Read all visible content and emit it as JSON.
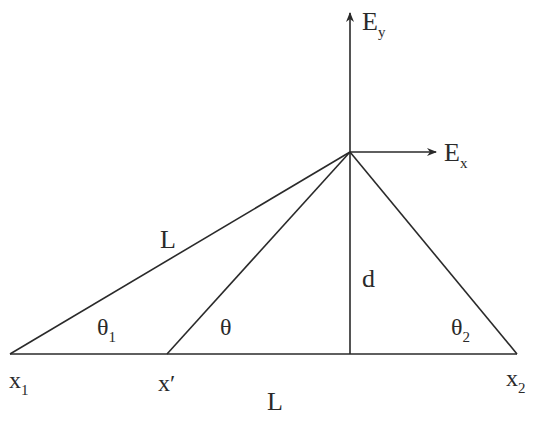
{
  "diagram": {
    "colors": {
      "line": "#2a2a2a",
      "background": "#ffffff"
    },
    "points": {
      "x1": [
        10,
        354
      ],
      "x_prime": [
        167,
        354
      ],
      "foot": [
        350,
        354
      ],
      "x2": [
        517,
        354
      ],
      "apex": [
        350,
        152
      ]
    },
    "labels": {
      "Ey": {
        "main": "E",
        "sub": "y"
      },
      "Ex": {
        "main": "E",
        "sub": "x"
      },
      "L_hyp": "L",
      "d": "d",
      "theta1": {
        "main": "θ",
        "sub": "1"
      },
      "theta": "θ",
      "theta2": {
        "main": "θ",
        "sub": "2"
      },
      "x1": {
        "main": "x",
        "sub": "1"
      },
      "xprime": "x′",
      "x2": {
        "main": "x",
        "sub": "2"
      },
      "L_base": "L"
    }
  }
}
